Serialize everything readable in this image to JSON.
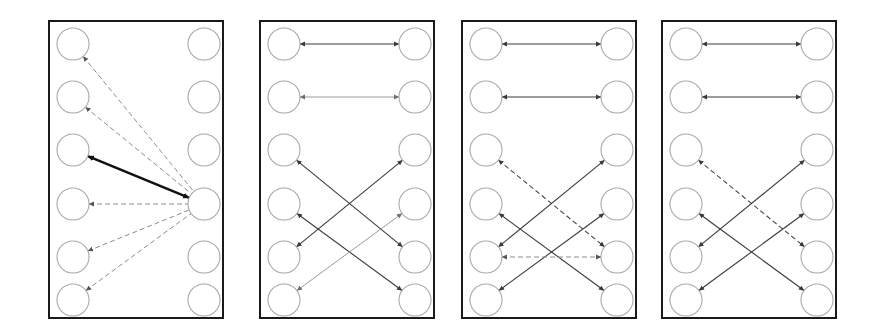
{
  "figure": {
    "width": 873,
    "height": 336,
    "background_color": "#ffffff",
    "panel_count": 4,
    "nodes_per_side": 6,
    "node_radius": 16,
    "node_stroke_color": "#a9a9a9",
    "node_fill_color": "#ffffff",
    "frame_stroke_color": "#1a1a1a"
  },
  "edge_styles": {
    "solid_thick_black": {
      "color": "#111111",
      "width": 2.6,
      "dash": "none"
    },
    "solid_dark": {
      "color": "#3a3a3a",
      "width": 1.1,
      "dash": "none"
    },
    "solid_faded": {
      "color": "#9a9a9a",
      "width": 1.0,
      "dash": "none"
    },
    "dashed_gray": {
      "color": "#8c8c8c",
      "width": 1.0,
      "dash": "5,3"
    },
    "dashed_dark": {
      "color": "#4a4a4a",
      "width": 1.1,
      "dash": "5,3"
    }
  },
  "panels": [
    {
      "name": "panel-1",
      "frame": {
        "x": 49,
        "y": 21,
        "width": 174,
        "height": 297
      },
      "left_x": 73,
      "right_x": 204,
      "node_ys": [
        44,
        97,
        150,
        204,
        257,
        300
      ],
      "edges": [
        {
          "id": "p1-e1",
          "left": 1,
          "right": 4,
          "style": "dashed_gray",
          "arrow_left": true,
          "arrow_right": false
        },
        {
          "id": "p1-e2",
          "left": 2,
          "right": 4,
          "style": "dashed_gray",
          "arrow_left": true,
          "arrow_right": false
        },
        {
          "id": "p1-e3",
          "left": 3,
          "right": 4,
          "style": "solid_thick_black",
          "arrow_left": true,
          "arrow_right": true
        },
        {
          "id": "p1-e4",
          "left": 4,
          "right": 4,
          "style": "dashed_gray",
          "arrow_left": true,
          "arrow_right": false
        },
        {
          "id": "p1-e5",
          "left": 5,
          "right": 4,
          "style": "dashed_gray",
          "arrow_left": true,
          "arrow_right": false
        },
        {
          "id": "p1-e6",
          "left": 6,
          "right": 4,
          "style": "dashed_gray",
          "arrow_left": true,
          "arrow_right": false
        }
      ]
    },
    {
      "name": "panel-2",
      "frame": {
        "x": 260,
        "y": 21,
        "width": 174,
        "height": 297
      },
      "left_x": 284,
      "right_x": 415,
      "node_ys": [
        44,
        97,
        150,
        204,
        257,
        300
      ],
      "edges": [
        {
          "id": "p2-e1",
          "left": 1,
          "right": 1,
          "style": "solid_dark",
          "arrow_left": true,
          "arrow_right": true
        },
        {
          "id": "p2-e2",
          "left": 2,
          "right": 2,
          "style": "solid_faded",
          "arrow_left": true,
          "arrow_right": true
        },
        {
          "id": "p2-e3",
          "left": 3,
          "right": 5,
          "style": "solid_dark",
          "arrow_left": true,
          "arrow_right": true
        },
        {
          "id": "p2-e4",
          "left": 4,
          "right": 6,
          "style": "solid_dark",
          "arrow_left": true,
          "arrow_right": true
        },
        {
          "id": "p2-e5",
          "left": 5,
          "right": 3,
          "style": "solid_dark",
          "arrow_left": true,
          "arrow_right": true
        },
        {
          "id": "p2-e6",
          "left": 6,
          "right": 4,
          "style": "solid_faded",
          "arrow_left": true,
          "arrow_right": true
        }
      ]
    },
    {
      "name": "panel-3",
      "frame": {
        "x": 462,
        "y": 21,
        "width": 174,
        "height": 297
      },
      "left_x": 486,
      "right_x": 617,
      "node_ys": [
        44,
        97,
        150,
        204,
        257,
        300
      ],
      "edges": [
        {
          "id": "p3-e1",
          "left": 1,
          "right": 1,
          "style": "solid_dark",
          "arrow_left": true,
          "arrow_right": true
        },
        {
          "id": "p3-e2",
          "left": 2,
          "right": 2,
          "style": "solid_dark",
          "arrow_left": true,
          "arrow_right": true
        },
        {
          "id": "p3-e3",
          "left": 3,
          "right": 5,
          "style": "dashed_dark",
          "arrow_left": true,
          "arrow_right": true
        },
        {
          "id": "p3-e4",
          "left": 4,
          "right": 6,
          "style": "solid_dark",
          "arrow_left": true,
          "arrow_right": true
        },
        {
          "id": "p3-e5",
          "left": 5,
          "right": 3,
          "style": "solid_dark",
          "arrow_left": true,
          "arrow_right": true
        },
        {
          "id": "p3-e6",
          "left": 6,
          "right": 4,
          "style": "solid_dark",
          "arrow_left": true,
          "arrow_right": true
        },
        {
          "id": "p3-e7",
          "left": 5,
          "right": 5,
          "style": "dashed_gray",
          "arrow_left": true,
          "arrow_right": true
        }
      ]
    },
    {
      "name": "panel-4",
      "frame": {
        "x": 662,
        "y": 21,
        "width": 174,
        "height": 297
      },
      "left_x": 686,
      "right_x": 817,
      "node_ys": [
        44,
        97,
        150,
        204,
        257,
        300
      ],
      "edges": [
        {
          "id": "p4-e1",
          "left": 1,
          "right": 1,
          "style": "solid_dark",
          "arrow_left": true,
          "arrow_right": true
        },
        {
          "id": "p4-e2",
          "left": 2,
          "right": 2,
          "style": "solid_dark",
          "arrow_left": true,
          "arrow_right": true
        },
        {
          "id": "p4-e3",
          "left": 3,
          "right": 5,
          "style": "dashed_dark",
          "arrow_left": true,
          "arrow_right": true
        },
        {
          "id": "p4-e4",
          "left": 4,
          "right": 6,
          "style": "solid_dark",
          "arrow_left": true,
          "arrow_right": true
        },
        {
          "id": "p4-e5",
          "left": 5,
          "right": 3,
          "style": "solid_dark",
          "arrow_left": true,
          "arrow_right": true
        },
        {
          "id": "p4-e6",
          "left": 6,
          "right": 4,
          "style": "solid_dark",
          "arrow_left": true,
          "arrow_right": true
        }
      ]
    }
  ]
}
